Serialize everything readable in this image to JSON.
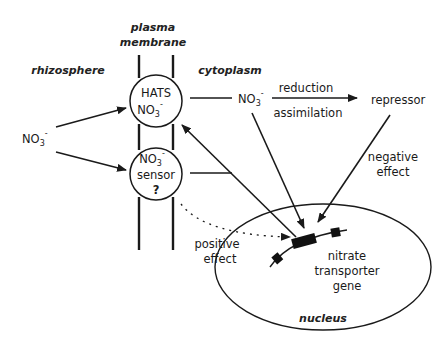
{
  "diagram": {
    "regions": {
      "plasma_membrane_line1": "plasma",
      "plasma_membrane_line2": "membrane",
      "rhizosphere": "rhizosphere",
      "cytoplasm": "cytoplasm",
      "nucleus": "nucleus"
    },
    "nodes": {
      "external_nitrate": {
        "base": "NO",
        "sub": "3",
        "sup": "-"
      },
      "hats": {
        "line1": "HATS",
        "base": "NO",
        "sub": "3",
        "sup": "-"
      },
      "sensor": {
        "base": "NO",
        "sub": "3",
        "sup": "-",
        "line2": "sensor",
        "mark": "?"
      },
      "cytoplasmic_nitrate": {
        "base": "NO",
        "sub": "3",
        "sup": "-"
      },
      "repressor": "repressor",
      "gene_line1": "nitrate",
      "gene_line2": "transporter",
      "gene_line3": "gene"
    },
    "edge_labels": {
      "reduction": "reduction",
      "assimilation": "assimilation",
      "negative_line1": "negative",
      "negative_line2": "effect",
      "positive_line1": "positive",
      "positive_line2": "effect"
    },
    "edges": [
      {
        "from": "external_nitrate",
        "to": "hats",
        "style": "solid-arrow"
      },
      {
        "from": "external_nitrate",
        "to": "sensor",
        "style": "solid-arrow"
      },
      {
        "from": "hats",
        "to": "cytoplasmic_nitrate",
        "style": "line"
      },
      {
        "from": "cytoplasmic_nitrate",
        "to": "repressor",
        "style": "solid-arrow",
        "label": "reduction / assimilation"
      },
      {
        "from": "cytoplasmic_nitrate",
        "to": "gene",
        "style": "solid-arrow"
      },
      {
        "from": "repressor",
        "to": "gene",
        "style": "solid-arrow",
        "label": "negative effect"
      },
      {
        "from": "sensor",
        "to": "gene",
        "style": "line"
      },
      {
        "from": "gene-junction",
        "to": "hats",
        "style": "solid-arrow"
      },
      {
        "from": "sensor",
        "to": "gene",
        "style": "dotted-arrow",
        "label": "positive effect"
      }
    ]
  }
}
